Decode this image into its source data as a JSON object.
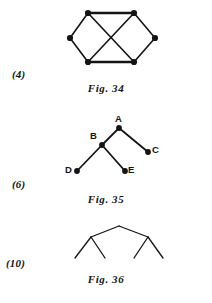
{
  "page": {
    "background_color": "#ffffff",
    "ink_color": "#141414",
    "width": 212,
    "height": 303
  },
  "figures": [
    {
      "id": "fig-34",
      "number_label": "(4)",
      "caption": "Fig. 34",
      "type": "graph-diagram",
      "description": "Six-vertex graph with two crossing diagonals",
      "vertices": [
        {
          "name": "top-left",
          "x": 88,
          "y": 13
        },
        {
          "name": "top-right",
          "x": 134,
          "y": 13
        },
        {
          "name": "left",
          "x": 70,
          "y": 38
        },
        {
          "name": "right",
          "x": 155,
          "y": 38
        },
        {
          "name": "bottom-left",
          "x": 88,
          "y": 62
        },
        {
          "name": "bottom-right",
          "x": 134,
          "y": 62
        }
      ],
      "edges": [
        [
          "top-left",
          "top-right"
        ],
        [
          "top-left",
          "left"
        ],
        [
          "left",
          "bottom-left"
        ],
        [
          "bottom-left",
          "bottom-right"
        ],
        [
          "bottom-right",
          "right"
        ],
        [
          "right",
          "top-right"
        ],
        [
          "top-left",
          "bottom-right"
        ],
        [
          "top-right",
          "bottom-left"
        ]
      ]
    },
    {
      "id": "fig-35",
      "number_label": "(6)",
      "caption": "Fig. 35",
      "type": "tree-diagram",
      "description": "Labelled tree rooted at A with children B and C, and B with children D and E",
      "vertices": [
        {
          "name": "A",
          "label": "A",
          "x": 119,
          "y": 128,
          "label_x": 115,
          "label_y": 114
        },
        {
          "name": "B",
          "label": "B",
          "x": 102,
          "y": 145,
          "label_x": 90,
          "label_y": 131
        },
        {
          "name": "C",
          "label": "C",
          "x": 148,
          "y": 152,
          "label_x": 152,
          "label_y": 140
        },
        {
          "name": "D",
          "label": "D",
          "x": 77,
          "y": 171,
          "label_x": 65,
          "label_y": 162
        },
        {
          "name": "E",
          "label": "E",
          "x": 125,
          "y": 171,
          "label_x": 128,
          "label_y": 162
        }
      ],
      "edges": [
        [
          "A",
          "B"
        ],
        [
          "A",
          "C"
        ],
        [
          "B",
          "D"
        ],
        [
          "B",
          "E"
        ]
      ]
    },
    {
      "id": "fig-36",
      "number_label": "(10)",
      "caption": "Fig. 36",
      "type": "binary-tree-outline",
      "description": "Unlabelled binary tree outline with an apex, two internal nodes and four leaves",
      "nodes": [
        {
          "name": "apex",
          "x": 119,
          "y": 226
        },
        {
          "name": "left-node",
          "x": 91,
          "y": 237
        },
        {
          "name": "right-node",
          "x": 148,
          "y": 237
        },
        {
          "name": "leaf-1",
          "x": 75,
          "y": 258
        },
        {
          "name": "leaf-2",
          "x": 105,
          "y": 258
        },
        {
          "name": "leaf-3",
          "x": 134,
          "y": 258
        },
        {
          "name": "leaf-4",
          "x": 163,
          "y": 258
        }
      ],
      "edges": [
        [
          "apex",
          "left-node"
        ],
        [
          "apex",
          "right-node"
        ],
        [
          "left-node",
          "leaf-1"
        ],
        [
          "left-node",
          "leaf-2"
        ],
        [
          "right-node",
          "leaf-3"
        ],
        [
          "right-node",
          "leaf-4"
        ]
      ]
    }
  ]
}
